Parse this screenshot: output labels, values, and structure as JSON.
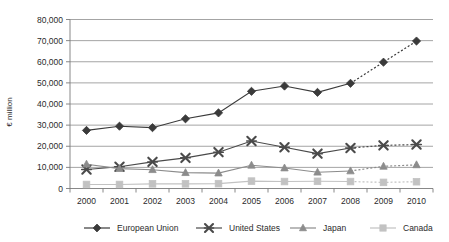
{
  "chart_data": {
    "type": "line",
    "title": "",
    "xlabel": "",
    "ylabel": "€ million",
    "x": [
      "2000",
      "2001",
      "2002",
      "2003",
      "2004",
      "2005",
      "2006",
      "2007",
      "2008",
      "2009",
      "2010"
    ],
    "categories": [
      "2000",
      "2001",
      "2002",
      "2003",
      "2004",
      "2005",
      "2006",
      "2007",
      "2008",
      "2009",
      "2010"
    ],
    "ylim": [
      0,
      80000
    ],
    "ytick_values": [
      0,
      10000,
      20000,
      30000,
      40000,
      50000,
      60000,
      70000,
      80000
    ],
    "ytick_labels": [
      "0",
      "10,000",
      "20,000",
      "30,000",
      "40,000",
      "50,000",
      "60,000",
      "70,000",
      "80,000"
    ],
    "grid": true,
    "legend_position": "bottom",
    "series": [
      {
        "name": "European Union",
        "marker": "diamond",
        "color": "#3a3a3a",
        "values": [
          27500,
          29500,
          28800,
          33000,
          35800,
          46000,
          48500,
          45500,
          49800,
          59800,
          69800
        ],
        "dashed_from_index": 8
      },
      {
        "name": "United States",
        "marker": "x-cross",
        "color": "#4a4a4a",
        "values": [
          9000,
          10300,
          12600,
          14500,
          17200,
          22500,
          19500,
          16500,
          19200,
          20400,
          20800
        ],
        "dashed_from_index": 8
      },
      {
        "name": "Japan",
        "marker": "triangle",
        "color": "#8c8c8c",
        "values": [
          11500,
          9400,
          8900,
          7500,
          7300,
          11000,
          9700,
          7700,
          8300,
          10500,
          11200
        ],
        "dashed_from_index": 8
      },
      {
        "name": "Canada",
        "marker": "square",
        "color": "#c2c2c2",
        "values": [
          1900,
          1900,
          2200,
          2200,
          2300,
          3500,
          3300,
          3400,
          3300,
          2900,
          3200
        ],
        "dashed_from_index": 8
      }
    ]
  },
  "legend": {
    "items": [
      {
        "label": "European Union"
      },
      {
        "label": "United States"
      },
      {
        "label": "Japan"
      },
      {
        "label": "Canada"
      }
    ]
  },
  "colors": {
    "european_union": "#3a3a3a",
    "united_states": "#4a4a4a",
    "japan": "#8c8c8c",
    "canada": "#c2c2c2",
    "gridline": "#8d8d8d",
    "axis": "#7a7a7a",
    "background": "#ffffff"
  }
}
